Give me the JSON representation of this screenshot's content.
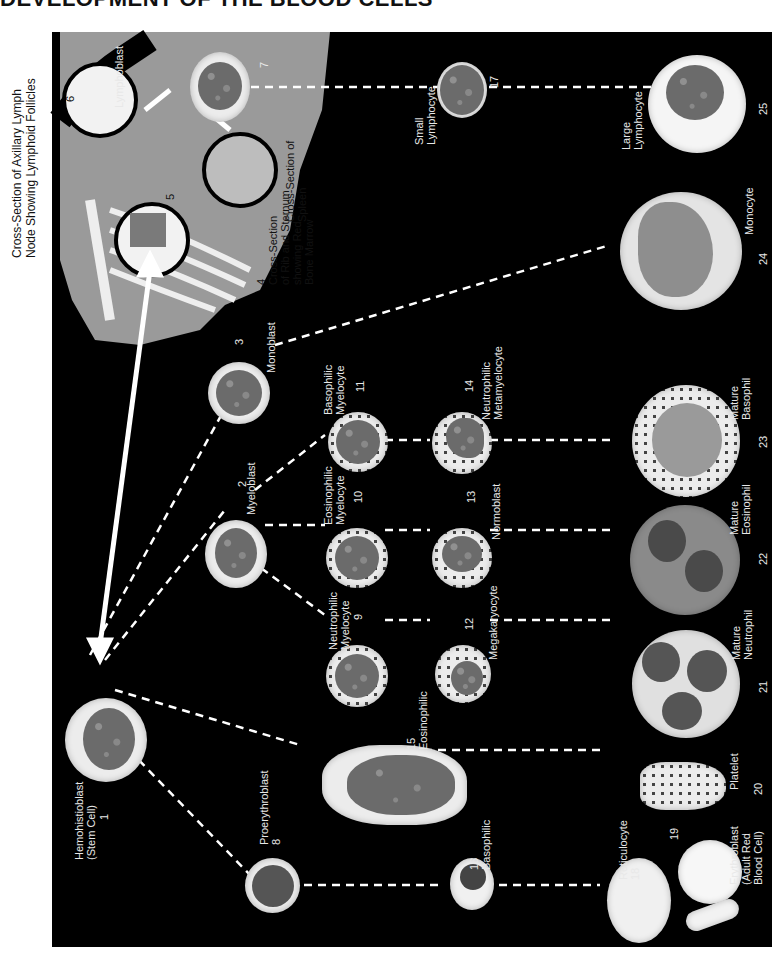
{
  "title": "DEVELOPMENT OF THE BLOOD CELLS",
  "orientation": "rotated 90 degrees; labels read bottom-to-top",
  "anatomy": {
    "lymph_node_caption": [
      "Cross-Section of Axillary Lymph",
      "Node Showing Lymphoid Follicles"
    ],
    "lymph_node_number": "6",
    "spleen_caption": [
      "Cross-Section of",
      "Spleen"
    ],
    "spleen_number": "5",
    "rib_caption": [
      "Cross-Section",
      "of Rib and Sternum",
      "showing Red",
      "Bone Marrow"
    ],
    "rib_number": "4"
  },
  "cells": [
    {
      "id": "1",
      "lines": [
        "Hemohistioblast",
        "(Stem Cell)"
      ]
    },
    {
      "id": "2",
      "lines": [
        "Myeloblast"
      ]
    },
    {
      "id": "3",
      "lines": [
        "Monoblast"
      ]
    },
    {
      "id": "7",
      "lines": [
        "Lymphoblast"
      ]
    },
    {
      "id": "8",
      "lines": [
        "Proerythroblast"
      ]
    },
    {
      "id": "9",
      "lines": [
        "Neutrophilic",
        "Myelocyte"
      ]
    },
    {
      "id": "10",
      "lines": [
        "Eosinophilic",
        "Myelocyte"
      ]
    },
    {
      "id": "11",
      "lines": [
        "Basophilic",
        "Myelocyte"
      ]
    },
    {
      "id": "12",
      "lines": [
        "Megakaryocyte"
      ]
    },
    {
      "id": "13",
      "lines": [
        "Normoblast"
      ]
    },
    {
      "id": "14",
      "lines": [
        "Neutrophilic",
        "Metamyelocyte"
      ]
    },
    {
      "id": "15",
      "lines": [
        "Eosinophilic",
        "Metamyelocyte"
      ]
    },
    {
      "id": "16",
      "lines": [
        "Basophilic",
        "Metamyelocyte"
      ]
    },
    {
      "id": "17",
      "lines": [
        "Small",
        "Lymphocyte"
      ]
    },
    {
      "id": "18",
      "lines": [
        "Reticulocyte"
      ]
    },
    {
      "id": "19",
      "lines": [
        "Erythroblast",
        "(Adult Red",
        "Blood Cell)"
      ]
    },
    {
      "id": "20",
      "lines": [
        "Platelet"
      ]
    },
    {
      "id": "21",
      "lines": [
        "Mature",
        "Neutrophil"
      ]
    },
    {
      "id": "22",
      "lines": [
        "Mature",
        "Eosinophil"
      ]
    },
    {
      "id": "23",
      "lines": [
        "Mature",
        "Basophil"
      ]
    },
    {
      "id": "24",
      "lines": [
        "Monocyte"
      ]
    },
    {
      "id": "25",
      "lines": [
        "Large",
        "Lymphocyte"
      ]
    }
  ],
  "colors": {
    "background": "#000000",
    "page": "#ffffff",
    "cell_cytoplasm": "#ececec",
    "nucleus": "#6b6b6b",
    "anatomy_fill": "#9a9a9a",
    "lines": "#ffffff"
  }
}
